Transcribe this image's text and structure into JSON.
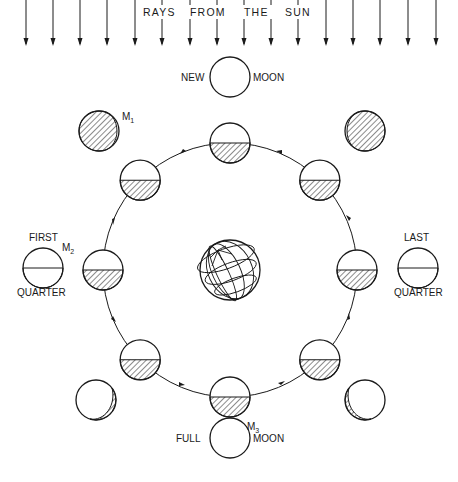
{
  "title": "RAYS FROM THE SUN",
  "rays": {
    "label_words": [
      "RAYS",
      "FROM",
      "THE",
      "SUN"
    ],
    "x_positions": [
      26,
      53,
      80,
      107,
      135,
      162,
      190,
      217,
      244,
      271,
      298,
      326,
      353,
      380,
      408,
      436
    ]
  },
  "labels": {
    "new_moon_left": "NEW",
    "new_moon_right": "MOON",
    "full_moon_left": "FULL",
    "full_moon_right": "MOON",
    "first_quarter_top": "FIRST",
    "first_quarter_bottom": "QUARTER",
    "last_quarter_top": "LAST",
    "last_quarter_bottom": "QUARTER",
    "m1": "M",
    "m1_sub": "1",
    "m2": "M",
    "m2_sub": "2",
    "m3": "M",
    "m3_sub": "3"
  },
  "orbit": {
    "center": [
      230,
      270
    ],
    "radius": 127,
    "direction": "counterclockwise"
  },
  "earth": {
    "center": [
      230,
      270
    ],
    "radius": 30
  },
  "colors": {
    "ink": "#1a1a1a",
    "background": "#ffffff"
  },
  "outer_phases": [
    {
      "name": "new-moon",
      "cx": 230,
      "cy": 77
    },
    {
      "name": "waxing-crescent-m1",
      "cx": 99,
      "cy": 131
    },
    {
      "name": "first-quarter-m2",
      "cx": 43,
      "cy": 268
    },
    {
      "name": "waxing-gibbous",
      "cx": 96,
      "cy": 400
    },
    {
      "name": "full-moon-m3",
      "cx": 230,
      "cy": 438
    },
    {
      "name": "waning-gibbous",
      "cx": 365,
      "cy": 400
    },
    {
      "name": "last-quarter",
      "cx": 418,
      "cy": 268
    },
    {
      "name": "waning-crescent",
      "cx": 365,
      "cy": 131
    }
  ]
}
